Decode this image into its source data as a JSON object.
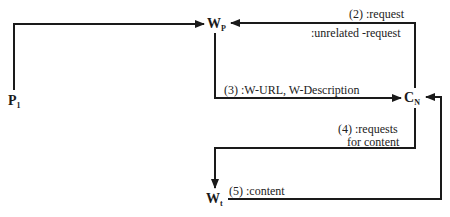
{
  "nodes": {
    "p1": {
      "main": "P",
      "sub": "1"
    },
    "wp": {
      "main": "W",
      "sub": "P"
    },
    "cn": {
      "main": "C",
      "sub": "N"
    },
    "wt": {
      "main": "W",
      "sub": "t"
    }
  },
  "edges": {
    "e1": {
      "from": "P1",
      "to": "WP",
      "label": ""
    },
    "e2": {
      "from": "CN",
      "to": "WP",
      "label_line1": "(2) :request",
      "label_line2": ":unrelated -request"
    },
    "e3": {
      "from": "WP",
      "to": "CN",
      "label": "(3) :W-URL, W-Description"
    },
    "e4": {
      "from": "CN",
      "to": "Wt",
      "label_line1": "(4) :requests",
      "label_line2": "for content"
    },
    "e5": {
      "from": "Wt",
      "to": "CN",
      "label": "(5) :content"
    }
  },
  "colors": {
    "line": "#1a1a1a",
    "text": "#1a1a1a",
    "background": "#ffffff"
  }
}
